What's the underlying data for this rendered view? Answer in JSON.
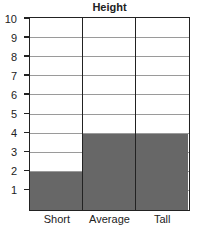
{
  "chart_data": {
    "type": "bar",
    "title": "Height",
    "categories": [
      "Short",
      "Average",
      "Tall"
    ],
    "values": [
      2,
      4,
      4
    ],
    "xlabel": "",
    "ylabel": "",
    "ylim": [
      0,
      10
    ],
    "yticks": [
      "1",
      "2",
      "3",
      "4",
      "5",
      "6",
      "7",
      "8",
      "9",
      "10"
    ],
    "grid": true,
    "bar_color": "#676767"
  }
}
